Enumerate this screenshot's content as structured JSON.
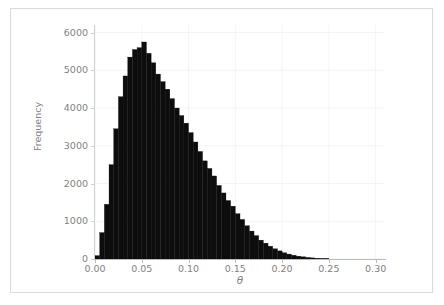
{
  "figure": {
    "background_color": "#ffffff",
    "frame_color": "#d9dadb",
    "axis_color": "#b9babb",
    "grid_color": "#f4f4f5",
    "tick_text_color": "#7f7f7f"
  },
  "axis_titles": {
    "x": "θ",
    "y": "Frequency"
  },
  "ticks": {
    "y_labels": [
      "6000",
      "5000",
      "4000",
      "3000",
      "2000",
      "1000",
      "0"
    ],
    "x_labels": [
      "0.00",
      "0.05",
      "0.10",
      "0.15",
      "0.20",
      "0.25",
      "0.30"
    ]
  },
  "chart_data": {
    "type": "bar",
    "title": "",
    "xlabel": "θ",
    "ylabel": "Frequency",
    "xlim": [
      0.0,
      0.31
    ],
    "ylim": [
      0,
      6200
    ],
    "grid": true,
    "legend": null,
    "bar_color": "#0d0d0d",
    "bin_width": 0.005,
    "bin_left_edges": [
      0.0,
      0.005,
      0.01,
      0.015,
      0.02,
      0.025,
      0.03,
      0.035,
      0.04,
      0.045,
      0.05,
      0.055,
      0.06,
      0.065,
      0.07,
      0.075,
      0.08,
      0.085,
      0.09,
      0.095,
      0.1,
      0.105,
      0.11,
      0.115,
      0.12,
      0.125,
      0.13,
      0.135,
      0.14,
      0.145,
      0.15,
      0.155,
      0.16,
      0.165,
      0.17,
      0.175,
      0.18,
      0.185,
      0.19,
      0.195,
      0.2,
      0.205,
      0.21,
      0.215,
      0.22,
      0.225,
      0.23,
      0.235,
      0.24,
      0.245
    ],
    "values": [
      90,
      700,
      1450,
      2500,
      3450,
      4300,
      4850,
      5350,
      5550,
      5600,
      5750,
      5450,
      5200,
      4900,
      4700,
      4500,
      4250,
      4000,
      3800,
      3600,
      3350,
      3100,
      2850,
      2600,
      2400,
      2200,
      1950,
      1750,
      1550,
      1400,
      1200,
      1050,
      880,
      740,
      620,
      500,
      420,
      340,
      270,
      215,
      165,
      130,
      100,
      75,
      58,
      42,
      30,
      20,
      12,
      6
    ],
    "categories": [
      "0.000",
      "0.005",
      "0.010",
      "0.015",
      "0.020",
      "0.025",
      "0.030",
      "0.035",
      "0.040",
      "0.045",
      "0.050",
      "0.055",
      "0.060",
      "0.065",
      "0.070",
      "0.075",
      "0.080",
      "0.085",
      "0.090",
      "0.095",
      "0.100",
      "0.105",
      "0.110",
      "0.115",
      "0.120",
      "0.125",
      "0.130",
      "0.135",
      "0.140",
      "0.145",
      "0.150",
      "0.155",
      "0.160",
      "0.165",
      "0.170",
      "0.175",
      "0.180",
      "0.185",
      "0.190",
      "0.195",
      "0.200",
      "0.205",
      "0.210",
      "0.215",
      "0.220",
      "0.225",
      "0.230",
      "0.235",
      "0.240",
      "0.245"
    ],
    "peak_value": 5750,
    "peak_bin": "0.050"
  }
}
